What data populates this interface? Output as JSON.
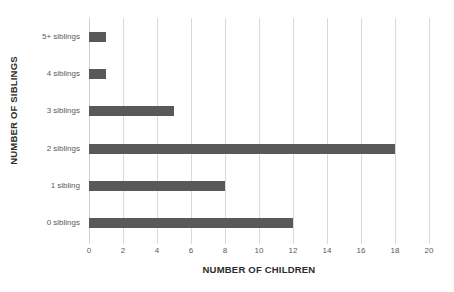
{
  "chart_data": {
    "type": "bar",
    "orientation": "horizontal",
    "title": "",
    "xlabel": "NUMBER OF CHILDREN",
    "ylabel": "NUMBER OF SIBLINGS",
    "categories": [
      "0 siblings",
      "1 sibling",
      "2 siblings",
      "3 siblings",
      "4 siblings",
      "5+ siblings"
    ],
    "values": [
      12,
      8,
      18,
      5,
      1,
      1
    ],
    "xlim": [
      0,
      20
    ],
    "xticks": [
      0,
      2,
      4,
      6,
      8,
      10,
      12,
      14,
      16,
      18,
      20
    ],
    "xtick_labels": [
      "0",
      "2",
      "4",
      "6",
      "8",
      "10",
      "12",
      "14",
      "16",
      "18",
      "20"
    ],
    "grid": "vertical",
    "legend": "none",
    "bar_color": "#595959",
    "gridline_color": "#d9d9d9",
    "axis_text_color": "#595959",
    "title_text_color": "#2b2b2b",
    "background_color": "#ffffff"
  }
}
